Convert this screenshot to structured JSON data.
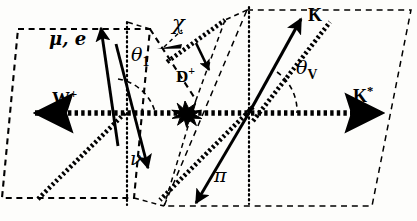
{
  "figure": {
    "type": "physics-decay-angle-diagram",
    "background_color": "#fdfdfb",
    "line_color": "#000000"
  },
  "labels": {
    "lepton": {
      "text": "μ, e",
      "x": 49,
      "y": 37
    },
    "neutrino": {
      "text": "ν",
      "x": 133,
      "y": 158
    },
    "w_boson": {
      "base": "W",
      "charge": "+",
      "x": 54,
      "y": 95
    },
    "d_meson": {
      "base": "D",
      "charge": "+",
      "x": 177,
      "y": 72
    },
    "kaon": {
      "text": "K",
      "x": 309,
      "y": 10
    },
    "pion": {
      "text": "π",
      "x": 216,
      "y": 173
    },
    "kstar": {
      "base": "K",
      "charge": "*",
      "x": 355,
      "y": 92
    },
    "theta_one": {
      "base": "θ",
      "sub": "1",
      "x": 132,
      "y": 52
    },
    "theta_v": {
      "base": "θ",
      "sub": "V",
      "x": 297,
      "y": 65
    },
    "chi": {
      "text": "χ",
      "x": 173,
      "y": 20
    }
  },
  "angles": [
    {
      "name": "theta_1",
      "symbol": "θ₁",
      "between": [
        "lepton",
        "W+ axis"
      ]
    },
    {
      "name": "theta_V",
      "symbol": "θ_V",
      "between": [
        "K",
        "K* axis"
      ]
    },
    {
      "name": "chi",
      "symbol": "χ",
      "between": [
        "lepton plane",
        "hadron plane"
      ]
    }
  ],
  "particles": [
    {
      "name": "mu-e",
      "label": "μ, e",
      "arrow": "up-right",
      "style": "solid"
    },
    {
      "name": "nu",
      "label": "ν",
      "arrow": "down",
      "style": "solid"
    },
    {
      "name": "W-plus",
      "label": "W+",
      "arrow": "left",
      "style": "thick-dotted"
    },
    {
      "name": "D-plus",
      "label": "D+",
      "arrow": "down-right",
      "style": "solid-small"
    },
    {
      "name": "K",
      "label": "K",
      "arrow": "up-right",
      "style": "solid"
    },
    {
      "name": "pi",
      "label": "π",
      "arrow": "down-left",
      "style": "solid"
    },
    {
      "name": "K-star",
      "label": "K*",
      "arrow": "right",
      "style": "thick-dotted"
    }
  ],
  "planes": [
    {
      "name": "lepton-plane",
      "shape": "parallelogram",
      "style": "dashed"
    },
    {
      "name": "hadron-plane",
      "shape": "parallelogram",
      "style": "dashed"
    }
  ],
  "vertex": {
    "name": "decay-vertex",
    "x": 185,
    "y": 113,
    "style": "starburst-blob"
  }
}
